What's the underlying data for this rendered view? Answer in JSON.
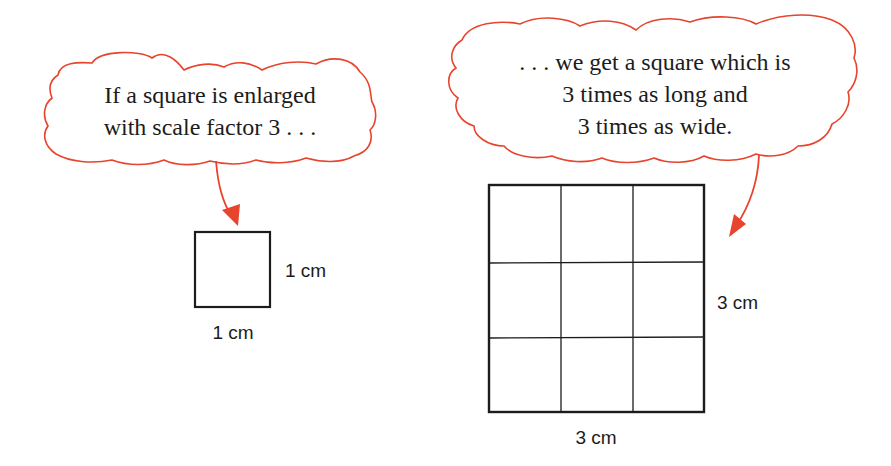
{
  "colors": {
    "accent": "#e8432c",
    "ink": "#1c1c1c",
    "background": "#ffffff"
  },
  "left_bubble": {
    "lines": [
      "If a square is enlarged",
      "with scale factor 3 . . ."
    ]
  },
  "right_bubble": {
    "lines": [
      ". . . we get a square which is",
      "3 times as long and",
      "3 times as wide."
    ]
  },
  "small_square": {
    "side_label": "1 cm",
    "bottom_label": "1 cm",
    "grid": [
      1,
      1
    ]
  },
  "large_square": {
    "side_label": "3 cm",
    "bottom_label": "3 cm",
    "grid": [
      3,
      3
    ]
  }
}
